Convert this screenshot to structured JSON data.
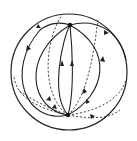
{
  "diagram": {
    "title": "Flow lines on a sphere between two poles",
    "sphere": {
      "cx": 69,
      "cy": 72,
      "r": 58
    },
    "nodes": [
      {
        "id": "north-pole",
        "x": 70,
        "y": 25
      },
      {
        "id": "south-pole",
        "x": 68,
        "y": 115
      }
    ],
    "front_curves": [
      "M68 115 C 50 95, 62 40, 70 25",
      "M68 115 C 75 90, 72 45, 70 25",
      "M68 115 C 105 95, 115 50, 70 25",
      "M68 115 C 30 110, 20 55, 70 25",
      "M68 115 C 25 125, 5 70, 40 30 C 50 22, 62 22, 70 25",
      "M70 25 C 95 18, 120 30, 126 60"
    ],
    "back_curves": [
      "M68 115 C 40 95, 45 40, 62 15",
      "M68 115 C 90 95, 95 40, 98 20",
      "M68 115 C 45 110, 15 100, 14 75",
      "M68 115 C 95 112, 120 100, 126 80",
      "M68 115 C 40 105, 25 95, 18 90",
      "M68 115 C 95 120, 110 118, 120 110"
    ],
    "colors": {
      "line": "#222222",
      "background": "#ffffff"
    }
  }
}
